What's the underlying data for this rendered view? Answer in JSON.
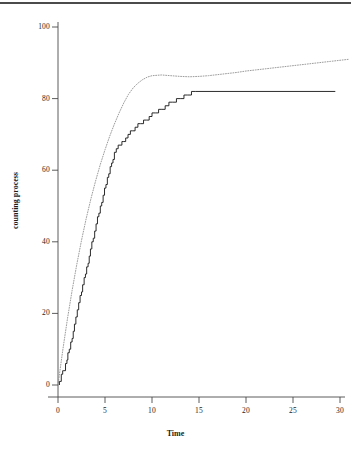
{
  "figure": {
    "background": "#ffffff",
    "ink_color": "#1d1d1d",
    "step_color": "#141414",
    "smooth_color": "#8a8a8a"
  },
  "chart_data": {
    "type": "line",
    "title": "",
    "subtitle": "",
    "xlabel": "Time",
    "ylabel": "counting process",
    "xlim": [
      -0.8,
      31.2
    ],
    "ylim": [
      -3,
      103
    ],
    "grid": false,
    "legend": null,
    "xticks": [
      0,
      5,
      10,
      15,
      20,
      25,
      30
    ],
    "xticklabels": [
      "0",
      "5",
      "10",
      "15",
      "20",
      "25",
      "30"
    ],
    "yticks": [
      0,
      20,
      40,
      60,
      80,
      100
    ],
    "yticklabels": [
      "0",
      "20",
      "40",
      "60",
      "80",
      "100"
    ],
    "annotations": [],
    "series": [
      {
        "name": "counting process",
        "style": "step",
        "color": "#141414",
        "linewidth": 0.9,
        "x": [
          0.15,
          0.35,
          0.5,
          0.62,
          0.8,
          0.95,
          1.05,
          1.2,
          1.35,
          1.5,
          1.62,
          1.75,
          1.9,
          2.05,
          2.2,
          2.35,
          2.5,
          2.62,
          2.78,
          2.92,
          3.05,
          3.2,
          3.32,
          3.45,
          3.6,
          3.75,
          3.9,
          4.05,
          4.2,
          4.35,
          4.5,
          4.65,
          4.8,
          4.95,
          5.1,
          5.25,
          5.4,
          5.55,
          5.7,
          5.85,
          6.0,
          6.2,
          6.4,
          6.6,
          6.8,
          7.0,
          7.2,
          7.45,
          7.7,
          7.95,
          8.2,
          8.5,
          8.8,
          9.1,
          9.4,
          9.7,
          10.0,
          10.35,
          10.7,
          11.05,
          11.4,
          11.8,
          12.2,
          12.6,
          13.0,
          13.4,
          13.8,
          14.2,
          14.6,
          15.0,
          29.5
        ],
        "y": [
          1,
          3,
          4,
          4,
          6,
          7,
          9,
          10,
          12,
          13,
          15,
          17,
          19,
          21,
          23,
          25,
          26,
          28,
          30,
          31,
          33,
          34,
          36,
          38,
          40,
          41,
          43,
          45,
          47,
          48,
          50,
          51,
          53,
          55,
          56,
          58,
          59,
          61,
          62,
          63,
          65,
          66,
          67,
          67,
          68,
          68,
          69,
          70,
          71,
          71,
          72,
          73,
          73,
          74,
          74,
          75,
          76,
          76,
          77,
          77,
          78,
          79,
          79,
          80,
          80,
          81,
          81,
          82,
          82,
          82,
          82
        ]
      },
      {
        "name": "fitted mean function",
        "style": "dotted",
        "color": "#8a8a8a",
        "linewidth": 0.8,
        "model": "A*(1-exp(-t/tau)) + c*t",
        "A": 82.0,
        "tau": 4.05,
        "c": 0.155,
        "x": [
          0.0,
          0.5,
          1.0,
          1.5,
          2.0,
          2.5,
          3.0,
          3.5,
          4.0,
          4.5,
          5.0,
          5.5,
          6.0,
          6.5,
          7.0,
          7.5,
          8.0,
          8.5,
          9.0,
          9.5,
          10.0,
          11.0,
          12.0,
          13.0,
          14.0,
          15.0,
          16.0,
          17.0,
          18.0,
          19.0,
          20.0,
          21.0,
          22.0,
          23.0,
          24.0,
          25.0,
          26.0,
          27.0,
          28.0,
          29.0,
          30.0,
          31.0
        ],
        "y": [
          0.0,
          9.6,
          18.4,
          26.4,
          33.7,
          40.4,
          46.5,
          52.0,
          57.0,
          61.6,
          65.7,
          69.5,
          72.9,
          76.0,
          78.8,
          81.2,
          83.0,
          84.3,
          85.3,
          86.0,
          86.4,
          86.6,
          86.4,
          86.2,
          86.1,
          86.2,
          86.4,
          86.7,
          87.0,
          87.3,
          87.7,
          88.0,
          88.3,
          88.6,
          88.9,
          89.2,
          89.5,
          89.8,
          90.1,
          90.4,
          90.7,
          91.0
        ]
      }
    ]
  }
}
